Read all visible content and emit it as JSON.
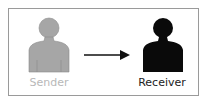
{
  "diagram": {
    "nodes": [
      {
        "id": "sender",
        "label": "Sender",
        "color": "#a6a6a6",
        "label_color": "#b8b8b8"
      },
      {
        "id": "receiver",
        "label": "Receiver",
        "color": "#0a0a0a",
        "label_color": "#222222"
      }
    ],
    "edges": [
      {
        "from": "sender",
        "to": "receiver",
        "type": "arrow"
      }
    ]
  }
}
